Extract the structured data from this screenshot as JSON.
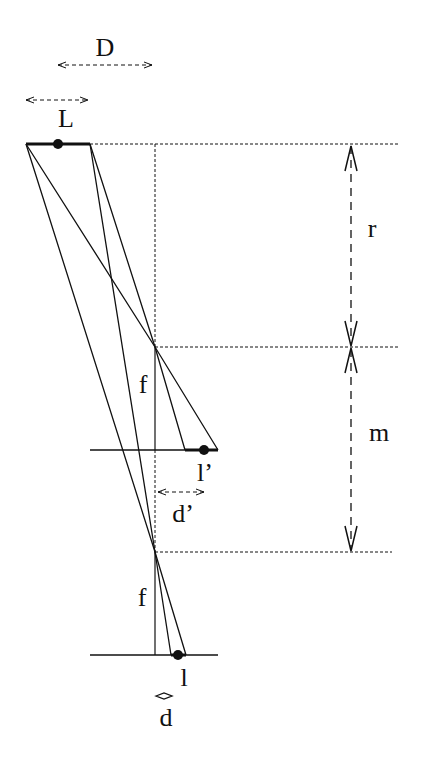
{
  "diagram": {
    "type": "optics-ray-diagram",
    "labels": {
      "D": "D",
      "L": "L",
      "r": "r",
      "m": "m",
      "f_upper": "f",
      "f_lower": "f",
      "l_prime": "l’",
      "d_prime": "d’",
      "l": "l",
      "d": "d"
    },
    "colors": {
      "ink": "#111111",
      "background": "#ffffff"
    }
  }
}
